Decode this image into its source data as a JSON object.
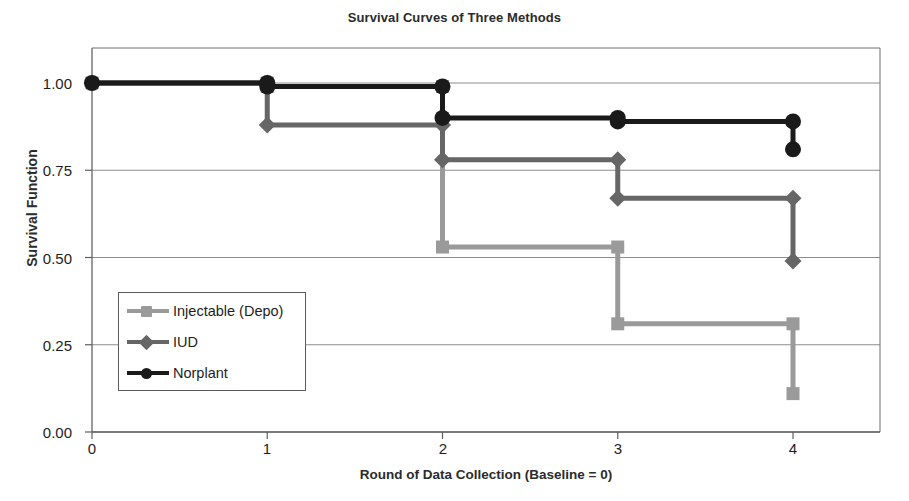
{
  "chart_data": {
    "type": "line",
    "subtype": "step",
    "title": "Survival Curves of Three Methods",
    "xlabel": "Round of Data Collection (Baseline = 0)",
    "ylabel": "Survival Function",
    "x": [
      0,
      1,
      2,
      3,
      4
    ],
    "xlim": [
      -0.08,
      4.5
    ],
    "ylim": [
      0.0,
      1.04
    ],
    "xtick_labels": [
      "0",
      "1",
      "2",
      "3",
      "4"
    ],
    "ytick_labels": [
      "0.00",
      "0.25",
      "0.50",
      "0.75",
      "1.00"
    ],
    "ytick_values": [
      0.0,
      0.25,
      0.5,
      0.75,
      1.0
    ],
    "grid": "horizontal",
    "legend_position": "inside-lower-left",
    "series": [
      {
        "name": "Injectable (Depo)",
        "marker": "square",
        "color": "#9a9a9a",
        "values": [
          1.0,
          0.99,
          0.53,
          0.31,
          0.11
        ],
        "step_values": [
          1.0,
          0.99,
          0.53,
          0.53,
          0.31,
          0.31,
          0.11
        ]
      },
      {
        "name": "IUD",
        "marker": "diamond",
        "color": "#666666",
        "values": [
          1.0,
          0.88,
          0.78,
          0.67,
          0.49
        ],
        "step_values": [
          1.0,
          0.88,
          0.88,
          0.78,
          0.78,
          0.67,
          0.67,
          0.49
        ]
      },
      {
        "name": "Norplant",
        "marker": "circle",
        "color": "#1a1a1a",
        "values": [
          1.0,
          0.99,
          0.9,
          0.89,
          0.81
        ],
        "step_values": [
          1.0,
          0.99,
          0.99,
          0.9,
          0.9,
          0.89,
          0.89,
          0.81
        ]
      }
    ]
  },
  "legend": {
    "items": [
      {
        "label": "Injectable (Depo)"
      },
      {
        "label": "IUD"
      },
      {
        "label": "Norplant"
      }
    ]
  },
  "axis": {
    "y_ticks": [
      "1.00",
      "0.75",
      "0.50",
      "0.25",
      "0.00"
    ],
    "x_ticks": [
      "0",
      "1",
      "2",
      "3",
      "4"
    ]
  }
}
